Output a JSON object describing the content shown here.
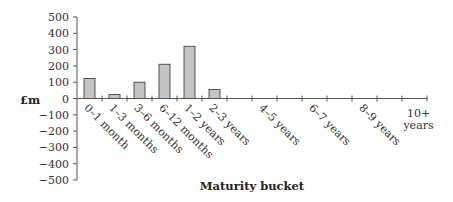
{
  "chart_data": {
    "type": "bar",
    "title": "",
    "xlabel": "Maturity bucket",
    "ylabel": "£m",
    "ylim": [
      -500,
      500
    ],
    "yticks": [
      500,
      400,
      300,
      200,
      100,
      0,
      -100,
      -200,
      -300,
      -400,
      -500
    ],
    "ytick_labels": [
      "500",
      "400",
      "300",
      "200",
      "100",
      "0",
      "−100",
      "−200",
      "−300",
      "−400",
      "−500"
    ],
    "categories": [
      "0–1 month",
      "1–3 months",
      "3–6 months",
      "6–12 months",
      "1–2 years",
      "2–3 years",
      "3–4 years",
      "4–5 years",
      "5–6 years",
      "6–7 years",
      "7–8 years",
      "8–9 years",
      "9–10 years",
      "10+ years"
    ],
    "category_label_visible": [
      true,
      true,
      true,
      true,
      true,
      true,
      false,
      true,
      false,
      true,
      false,
      true,
      false,
      true
    ],
    "values": [
      123,
      25,
      100,
      210,
      320,
      55,
      0,
      0,
      0,
      0,
      0,
      0,
      0,
      0
    ],
    "grid": false,
    "legend": "none",
    "colors": {
      "bar_fill": "#c4c4c4",
      "bar_stroke": "#444444",
      "axis": "#555555"
    }
  }
}
